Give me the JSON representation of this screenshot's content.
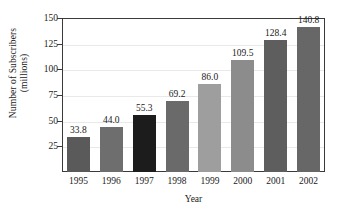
{
  "chart_data": {
    "type": "bar",
    "title": "",
    "xlabel": "Year",
    "ylabel": "Number of Subscribers (millions)",
    "ylabel_line1": "Number of Subscribers",
    "ylabel_line2": "(millions)",
    "categories": [
      "1995",
      "1996",
      "1997",
      "1998",
      "1999",
      "2000",
      "2001",
      "2002"
    ],
    "values": [
      33.8,
      44.0,
      55.3,
      69.2,
      86.0,
      109.5,
      128.4,
      140.8
    ],
    "value_labels": [
      "33.8",
      "44.0",
      "55.3",
      "69.2",
      "86.0",
      "109.5",
      "128.4",
      "140.8"
    ],
    "bar_colors": [
      "#5a5a5a",
      "#6e6e6e",
      "#1c1c1c",
      "#6a6a6a",
      "#9e9e9e",
      "#8c8c8c",
      "#5e5e5e",
      "#676767"
    ],
    "ylim": [
      0,
      150
    ],
    "yticks": [
      25,
      50,
      75,
      100,
      125,
      150
    ],
    "ytick_labels": [
      "25",
      "50",
      "75",
      "100",
      "125",
      "150"
    ],
    "grid": true,
    "grid_axis": "y",
    "legend": false,
    "legend_position": "none",
    "axis_color": "#3a3a3a",
    "gridline_color": "#e9e9e9",
    "background_color": "#ffffff",
    "text_color": "#1a1a1a"
  }
}
